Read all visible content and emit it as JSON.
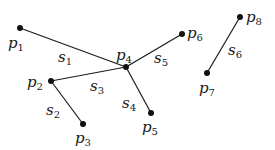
{
  "points": [
    {
      "id": "p1",
      "label": "p",
      "sub": "1",
      "x": 20,
      "y": 28,
      "lx": 8,
      "ly": 48
    },
    {
      "id": "p2",
      "label": "p",
      "sub": "2",
      "x": 51,
      "y": 81,
      "lx": 27,
      "ly": 87
    },
    {
      "id": "p3",
      "label": "p",
      "sub": "3",
      "x": 83,
      "y": 124,
      "lx": 75,
      "ly": 143
    },
    {
      "id": "p4",
      "label": "p",
      "sub": "4",
      "x": 126,
      "y": 67,
      "lx": 116,
      "ly": 60
    },
    {
      "id": "p5",
      "label": "p",
      "sub": "5",
      "x": 151,
      "y": 113,
      "lx": 142,
      "ly": 132
    },
    {
      "id": "p6",
      "label": "p",
      "sub": "6",
      "x": 182,
      "y": 34,
      "lx": 187,
      "ly": 38
    },
    {
      "id": "p7",
      "label": "p",
      "sub": "7",
      "x": 207,
      "y": 73,
      "lx": 199,
      "ly": 93
    },
    {
      "id": "p8",
      "label": "p",
      "sub": "8",
      "x": 240,
      "y": 17,
      "lx": 246,
      "ly": 22
    }
  ],
  "segments": [
    {
      "id": "s1",
      "label": "s",
      "sub": "1",
      "from": "p1",
      "to": "p4",
      "lx": 58,
      "ly": 62
    },
    {
      "id": "s2",
      "label": "s",
      "sub": "2",
      "from": "p2",
      "to": "p3",
      "lx": 46,
      "ly": 115
    },
    {
      "id": "s3",
      "label": "s",
      "sub": "3",
      "from": "p2",
      "to": "p4",
      "lx": 90,
      "ly": 91
    },
    {
      "id": "s4",
      "label": "s",
      "sub": "4",
      "from": "p4",
      "to": "p5",
      "lx": 122,
      "ly": 108
    },
    {
      "id": "s5",
      "label": "s",
      "sub": "5",
      "from": "p4",
      "to": "p6",
      "lx": 154,
      "ly": 63
    },
    {
      "id": "s6",
      "label": "s",
      "sub": "6",
      "from": "p7",
      "to": "p8",
      "lx": 228,
      "ly": 55
    }
  ],
  "colors": {
    "stroke": "#1a1a1a",
    "point": "#111111"
  }
}
